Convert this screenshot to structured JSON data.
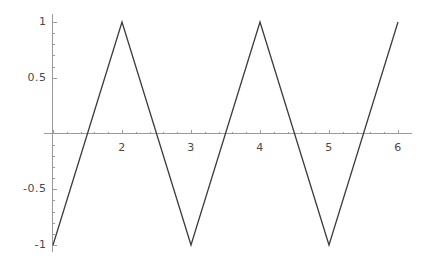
{
  "chart_data": {
    "type": "line",
    "title": "",
    "subtitle": "",
    "xlabel": "",
    "ylabel": "",
    "xlim": [
      1.0,
      6.0
    ],
    "ylim": [
      -1.0,
      1.0
    ],
    "grid": false,
    "legend": null,
    "series": [
      {
        "name": "triangle wave",
        "color": "#3c3c3c",
        "x": [
          1.0,
          2.0,
          3.0,
          4.0,
          5.0,
          6.0
        ],
        "values": [
          -1.0,
          1.0,
          -1.0,
          1.0,
          -1.0,
          1.0
        ]
      }
    ],
    "x_ticks": [
      {
        "value": 2,
        "label": "2"
      },
      {
        "value": 3,
        "label": "3"
      },
      {
        "value": 4,
        "label": "4"
      },
      {
        "value": 5,
        "label": "5"
      },
      {
        "value": 6,
        "label": "6"
      }
    ],
    "y_ticks": [
      {
        "value": 1,
        "label": "1"
      },
      {
        "value": 0.5,
        "label": "0.5"
      },
      {
        "value": -0.5,
        "label": "-0.5"
      },
      {
        "value": -1,
        "label": "-1"
      }
    ],
    "x_minor_ticks_per_interval": 4,
    "y_minor_ticks_per_interval": 4,
    "zero_crossings": [
      1.5,
      2.5,
      3.5,
      4.5,
      5.5
    ],
    "axis_color": "#9a9a9a",
    "tick_color": "#9a9a9a",
    "label_color": "#4a4a4a",
    "background_color": "#ffffff"
  },
  "axes": {
    "y_axis_name": "y-axis",
    "x_axis_name": "x-axis"
  }
}
